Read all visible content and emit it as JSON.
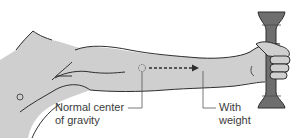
{
  "diagram": {
    "labels": {
      "normal_center_line1": "Normal center",
      "normal_center_line2": "of gravity",
      "with_weight_line1": "With",
      "with_weight_line2": "weight"
    },
    "colors": {
      "arm_fill": "#cfcfcf",
      "outline": "#2e2e2e",
      "dumbbell": "#6e6e6e",
      "leader_line": "#555555",
      "text": "#3a3a3a"
    },
    "icons": {
      "normal_center_marker": "dotted-circle",
      "shift_arrow": "dashed-right-arrow",
      "weight": "dumbbell"
    }
  }
}
